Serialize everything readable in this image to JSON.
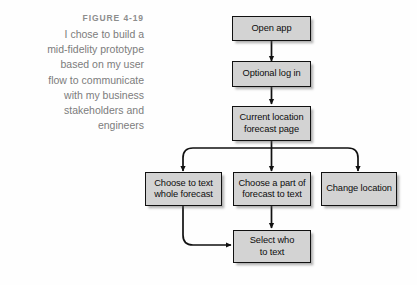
{
  "caption": {
    "label": "FIGURE 4-19",
    "lines": [
      "I chose to build a",
      "mid-fidelity prototype",
      "based on my user",
      "flow to communicate",
      "with my business",
      "stakeholders and",
      "engineers"
    ]
  },
  "colors": {
    "node_fill": "#d3d3d3",
    "node_border": "#111111",
    "connector": "#111111",
    "caption_label": "#8d8d8d",
    "caption_body": "#7c7c7c",
    "background": "#fefefe"
  },
  "diagram": {
    "type": "flowchart",
    "nodes": [
      {
        "id": "open-app",
        "label": "Open app",
        "lines": [
          "Open app"
        ]
      },
      {
        "id": "optional-log-in",
        "label": "Optional log in",
        "lines": [
          "Optional log in"
        ]
      },
      {
        "id": "current-location",
        "label": "Current location forecast page",
        "lines": [
          "Current location",
          "forecast page"
        ]
      },
      {
        "id": "text-whole",
        "label": "Choose to text whole forecast",
        "lines": [
          "Choose to text",
          "whole forecast"
        ]
      },
      {
        "id": "text-part",
        "label": "Choose a part of forecast to text",
        "lines": [
          "Choose a part of",
          "forecast to text"
        ]
      },
      {
        "id": "change-location",
        "label": "Change location",
        "lines": [
          "Change location"
        ]
      },
      {
        "id": "select-who",
        "label": "Select who to text",
        "lines": [
          "Select who",
          "to text"
        ]
      }
    ],
    "edges": [
      {
        "from": "open-app",
        "to": "optional-log-in"
      },
      {
        "from": "optional-log-in",
        "to": "current-location"
      },
      {
        "from": "current-location",
        "to": "text-whole"
      },
      {
        "from": "current-location",
        "to": "text-part"
      },
      {
        "from": "current-location",
        "to": "change-location"
      },
      {
        "from": "text-whole",
        "to": "select-who"
      },
      {
        "from": "text-part",
        "to": "select-who"
      }
    ]
  }
}
